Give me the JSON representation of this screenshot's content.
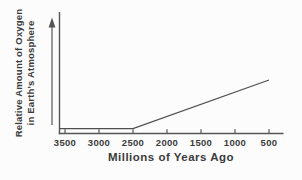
{
  "chart": {
    "ylabel_line1": "Relative Amount of Oxygen",
    "ylabel_line2": "in Earth's Atmosphere",
    "xlabel": "Millions of Years Ago"
  },
  "chart_data": {
    "type": "line",
    "title": "",
    "xlabel": "Millions of Years Ago",
    "ylabel": "Relative Amount of Oxygen in Earth's Atmosphere",
    "x_ticks": [
      "3500",
      "3000",
      "2500",
      "2000",
      "1500",
      "1000",
      "500"
    ],
    "x_tick_values": [
      3500,
      3000,
      2500,
      2000,
      1500,
      1000,
      500
    ],
    "x_axis_reversed": true,
    "y_axis_ticks": "none (relative scale indicated by upward arrow)",
    "grid": false,
    "legend": false,
    "series": [
      {
        "name": "relative oxygen amount",
        "points": [
          {
            "x": 3500,
            "y": 0.04
          },
          {
            "x": 2500,
            "y": 0.04
          },
          {
            "x": 500,
            "y": 0.44
          }
        ]
      }
    ]
  },
  "colors": {
    "axis": "#555555",
    "data_line": "#4f4f4f",
    "text": "#3b3b3b",
    "background": "#fcfcfc"
  }
}
